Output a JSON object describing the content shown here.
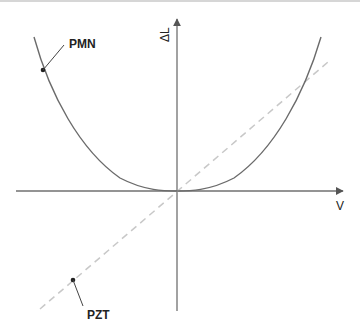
{
  "diagram": {
    "title": "",
    "axes": {
      "x_label": "V",
      "y_label": "ΔL"
    },
    "curves": [
      {
        "name": "PMN",
        "label": "PMN",
        "style": "solid",
        "shape": "quadratic (electrostrictive)",
        "color": "#6b6b6b"
      },
      {
        "name": "PZT",
        "label": "PZT",
        "style": "dashed",
        "shape": "linear (piezoelectric)",
        "color": "#c8c8c8"
      }
    ],
    "colors": {
      "axis": "#707070",
      "text": "#222222",
      "top_rule": "#d6d6d6"
    }
  }
}
